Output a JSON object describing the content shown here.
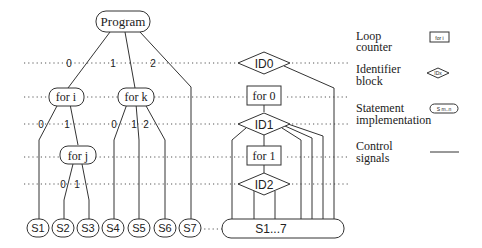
{
  "tree": {
    "root": "Program",
    "root_edges": [
      "0",
      "1",
      "2"
    ],
    "loops": {
      "for_i": "for i",
      "for_k": "for k",
      "for_j": "for j"
    },
    "for_i_edges": [
      "0",
      "1"
    ],
    "for_k_edges": [
      "0",
      "1",
      "2"
    ],
    "for_j_edges": [
      "0",
      "1"
    ],
    "statements": [
      "S1",
      "S2",
      "S3",
      "S4",
      "S5",
      "S6",
      "S7"
    ]
  },
  "control_structure": {
    "identifiers": [
      "ID0",
      "ID1",
      "ID2"
    ],
    "loop_counters": [
      "for 0",
      "for 1"
    ],
    "merged_statement": "S1...7"
  },
  "legend": {
    "items": [
      {
        "label_line1": "Loop",
        "label_line2": "counter",
        "symbol": "for i",
        "shape": "rectangle"
      },
      {
        "label_line1": "Identifier",
        "label_line2": "block",
        "symbol": "IDx",
        "shape": "diamond"
      },
      {
        "label_line1": "Statement",
        "label_line2": "implementation",
        "symbol": "S m..n",
        "shape": "rounded-pill"
      },
      {
        "label_line1": "Control",
        "label_line2": "signals",
        "symbol": "",
        "shape": "line"
      }
    ]
  }
}
